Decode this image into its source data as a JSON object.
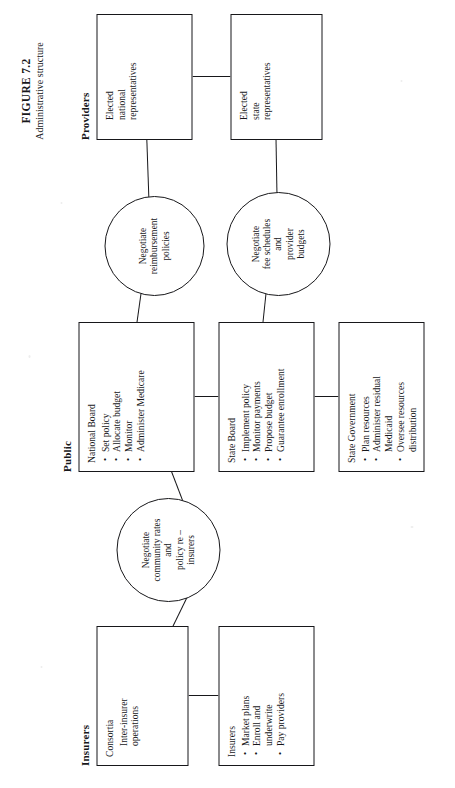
{
  "figure": {
    "number": "FIGURE 7.2",
    "subtitle": "Administrative structure"
  },
  "groups": {
    "insurers": "Insurers",
    "public": "Public",
    "providers": "Providers"
  },
  "nodes": {
    "consortia": {
      "title": "Consortia",
      "lines": [
        "Inter-insurer",
        "operations"
      ]
    },
    "insurers_box": {
      "title": "Insurers",
      "bullets": [
        "Market plans",
        "Enroll and\nunderwrite",
        "Pay providers"
      ]
    },
    "national_board": {
      "title": "National Board",
      "bullets": [
        "Set policy",
        "Allocate budget",
        "Monitor",
        "Administer Medicare"
      ]
    },
    "state_board": {
      "title": "State Board",
      "bullets": [
        "Implement policy",
        "Monitor payments",
        "Propose budget",
        "Guarantee enrollment"
      ]
    },
    "state_government": {
      "title": "State Government",
      "bullets": [
        "Plan resources",
        "Administer residual\nMedicaid",
        "Oversee resources\ndistribution"
      ]
    },
    "elected_national": {
      "lines": [
        "Elected",
        "national",
        "representatives"
      ]
    },
    "elected_state": {
      "lines": [
        "Elected",
        "state",
        "representatives"
      ]
    }
  },
  "circles": {
    "community_rates": "Negotiate\ncommunity rates\nand\npolicy re –\ninsurers",
    "reimbursement": "Negotiate\nreimbursement\npolicies",
    "fee_schedules": "Negotiate\nfee schedules\nand\nprovider\nbudgets"
  },
  "colors": {
    "ink": "#17171a",
    "paper": "#ffffff"
  }
}
